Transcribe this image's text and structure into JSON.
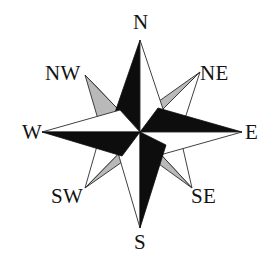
{
  "figure": {
    "type": "compass-rose",
    "background_color": "#ffffff",
    "center": {
      "x": 140,
      "y": 132
    }
  },
  "palette": {
    "dark": "#0d0d0d",
    "light": "#ffffff",
    "shade": "#b9b9b9",
    "shade_dark": "#9a9a9a",
    "outline": "#2b2b2b",
    "text": "#131313"
  },
  "labels": {
    "north": "N",
    "northeast": "NE",
    "east": "E",
    "southeast": "SE",
    "south": "S",
    "southwest": "SW",
    "west": "W",
    "northwest": "NW"
  },
  "points": [
    {
      "name": "north",
      "label": "N",
      "bearing_deg": 0,
      "order": "cardinal",
      "tip": {
        "x": 140,
        "y": 40
      },
      "left_fill": "dark",
      "right_fill": "light"
    },
    {
      "name": "northeast",
      "label": "NE",
      "bearing_deg": 45,
      "order": "ordinal",
      "tip": {
        "x": 200,
        "y": 72
      },
      "left_fill": "shade",
      "right_fill": "light"
    },
    {
      "name": "east",
      "label": "E",
      "bearing_deg": 90,
      "order": "cardinal",
      "tip": {
        "x": 242,
        "y": 132
      },
      "left_fill": "dark",
      "right_fill": "light"
    },
    {
      "name": "southeast",
      "label": "SE",
      "bearing_deg": 135,
      "order": "ordinal",
      "tip": {
        "x": 192,
        "y": 188
      },
      "left_fill": "shade",
      "right_fill": "light"
    },
    {
      "name": "south",
      "label": "S",
      "bearing_deg": 180,
      "order": "cardinal",
      "tip": {
        "x": 140,
        "y": 228
      },
      "left_fill": "dark",
      "right_fill": "light"
    },
    {
      "name": "southwest",
      "label": "SW",
      "bearing_deg": 225,
      "order": "ordinal",
      "tip": {
        "x": 85,
        "y": 188
      },
      "left_fill": "shade",
      "right_fill": "light"
    },
    {
      "name": "west",
      "label": "W",
      "bearing_deg": 270,
      "order": "cardinal",
      "tip": {
        "x": 42,
        "y": 132
      },
      "left_fill": "dark",
      "right_fill": "light"
    },
    {
      "name": "northwest",
      "label": "NW",
      "bearing_deg": 315,
      "order": "ordinal",
      "tip": {
        "x": 85,
        "y": 75
      },
      "left_fill": "shade",
      "right_fill": "light"
    }
  ]
}
